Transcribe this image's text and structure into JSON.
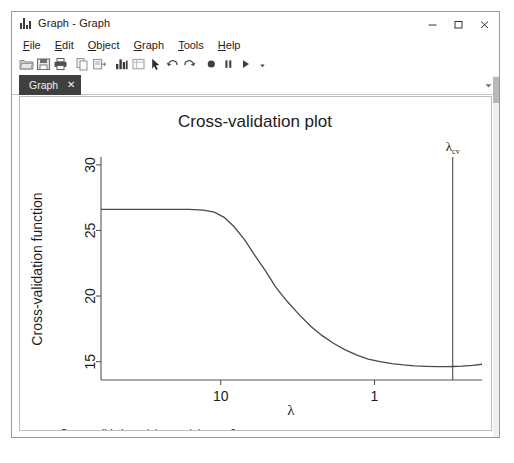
{
  "window": {
    "title": "Graph - Graph",
    "app_icon": "bar-chart-icon",
    "controls": {
      "minimize": "minimize-icon",
      "maximize": "maximize-icon",
      "close": "close-icon"
    }
  },
  "menu": {
    "items": [
      {
        "label": "File",
        "accel": "F"
      },
      {
        "label": "Edit",
        "accel": "E"
      },
      {
        "label": "Object",
        "accel": "O"
      },
      {
        "label": "Graph",
        "accel": "G"
      },
      {
        "label": "Tools",
        "accel": "T"
      },
      {
        "label": "Help",
        "accel": "H"
      }
    ]
  },
  "toolbar": {
    "buttons": [
      {
        "name": "open-icon",
        "title": "Open"
      },
      {
        "name": "save-icon",
        "title": "Save"
      },
      {
        "name": "print-icon",
        "title": "Print"
      },
      {
        "name": "copy-icon",
        "title": "Copy"
      },
      {
        "name": "paste-icon",
        "title": "Paste"
      },
      {
        "name": "graph-icon",
        "title": "Graph"
      },
      {
        "name": "grid-icon",
        "title": "Grid"
      },
      {
        "name": "pointer-icon",
        "title": "Select"
      },
      {
        "name": "undo-icon",
        "title": "Undo"
      },
      {
        "name": "redo-icon",
        "title": "Redo"
      },
      {
        "name": "record-icon",
        "title": "Record"
      },
      {
        "name": "pause-icon",
        "title": "Pause"
      },
      {
        "name": "play-icon",
        "title": "Play"
      },
      {
        "name": "more-icon",
        "title": "More"
      }
    ]
  },
  "tabs": {
    "active": "Graph",
    "close_glyph": "✕",
    "overflow_glyph": "▾"
  },
  "chart_data": {
    "type": "line",
    "title": "Cross-validation plot",
    "xlabel": "λ",
    "ylabel": "Cross-validation function",
    "x_scale": "log-reversed",
    "xticks": [
      "10",
      "1"
    ],
    "xtick_values": [
      10,
      1
    ],
    "yticks": [
      "15",
      "20",
      "25",
      "30"
    ],
    "ytick_values": [
      15,
      20,
      25,
      30
    ],
    "ylim": [
      13.6,
      30.6
    ],
    "xlim": [
      60,
      0.2
    ],
    "grid": false,
    "legend": "none",
    "series": [
      {
        "name": "cross-validation function",
        "x": [
          60,
          45,
          34,
          26,
          20,
          16,
          13,
          11,
          9.5,
          8.2,
          7.0,
          6.0,
          5.1,
          4.4,
          3.7,
          3.1,
          2.6,
          2.2,
          1.85,
          1.55,
          1.3,
          1.1,
          0.92,
          0.77,
          0.65,
          0.55,
          0.46,
          0.39,
          0.33,
          0.31,
          0.27,
          0.23,
          0.2
        ],
        "y": [
          26.6,
          26.6,
          26.6,
          26.6,
          26.6,
          26.6,
          26.55,
          26.4,
          26.0,
          25.3,
          24.3,
          23.1,
          21.9,
          20.7,
          19.6,
          18.6,
          17.7,
          17.0,
          16.4,
          15.9,
          15.5,
          15.2,
          15.0,
          14.85,
          14.75,
          14.68,
          14.64,
          14.62,
          14.62,
          14.63,
          14.66,
          14.72,
          14.8
        ]
      }
    ],
    "annotations": [
      {
        "name": "lambda-cv-line",
        "type": "vline",
        "x": 0.31,
        "label": "λ",
        "label_sub": "cv"
      }
    ],
    "footnotes": [
      {
        "symbol": "α",
        "sub": "cv",
        "text": "Cross-validation minimum alpha.  α=.2"
      },
      {
        "symbol": "λ",
        "sub": "cv",
        "text": "Cross-validation minimum lambda.  λ=.31, # Coefficients=118."
      }
    ]
  },
  "colors": {
    "window_border": "#9a9a9a",
    "tab_active_bg": "#3f3f3f",
    "tab_active_fg": "#f2f2f2",
    "plot_line": "#4a4a4a",
    "axis": "#555555",
    "text": "#1c1c1c"
  }
}
